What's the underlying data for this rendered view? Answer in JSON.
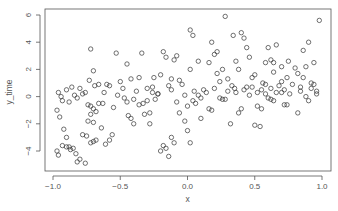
{
  "chart_data": {
    "type": "scatter",
    "title": "",
    "xlabel": "x",
    "ylabel": "y_time",
    "xlim": [
      -1.07,
      1.07
    ],
    "ylim": [
      -5.6,
      6.6
    ],
    "x_ticks": [
      -1.0,
      -0.5,
      0.0,
      0.5,
      1.0
    ],
    "x_tick_labels": [
      "-1.0",
      "-0.5",
      "0.0",
      "0.5",
      "1.0"
    ],
    "y_ticks": [
      -4,
      -2,
      0,
      2,
      4,
      6
    ],
    "y_tick_labels": [
      "-4",
      "-2",
      "0",
      "2",
      "4",
      "6"
    ],
    "grid": false,
    "legend": null,
    "marker": "open-circle",
    "marker_color": "#333333",
    "points": [
      [
        -0.96,
        0.3
      ],
      [
        -0.94,
        0.0
      ],
      [
        -0.93,
        -0.3
      ],
      [
        -0.9,
        0.5
      ],
      [
        -0.88,
        -0.4
      ],
      [
        -0.86,
        0.7
      ],
      [
        -0.84,
        0.1
      ],
      [
        -0.82,
        -0.1
      ],
      [
        -0.8,
        0.6
      ],
      [
        -0.78,
        0.2
      ],
      [
        -0.97,
        -1.0
      ],
      [
        -0.95,
        -1.5
      ],
      [
        -0.92,
        -2.4
      ],
      [
        -0.9,
        -3.0
      ],
      [
        -0.88,
        -3.7
      ],
      [
        -0.85,
        -3.8
      ],
      [
        -0.83,
        -4.2
      ],
      [
        -0.8,
        -4.6
      ],
      [
        -0.78,
        -2.8
      ],
      [
        -0.75,
        -2.9
      ],
      [
        -0.97,
        -4.0
      ],
      [
        -0.96,
        -4.3
      ],
      [
        -0.93,
        -3.6
      ],
      [
        -0.9,
        -3.7
      ],
      [
        -0.87,
        -3.9
      ],
      [
        -0.82,
        -4.8
      ],
      [
        -0.76,
        -4.9
      ],
      [
        -0.72,
        -3.4
      ],
      [
        -0.7,
        -3.3
      ],
      [
        -0.68,
        -3.2
      ],
      [
        -0.76,
        0.3
      ],
      [
        -0.74,
        -0.6
      ],
      [
        -0.72,
        -0.7
      ],
      [
        -0.7,
        -0.9
      ],
      [
        -0.72,
        -1.3
      ],
      [
        -0.68,
        -1.1
      ],
      [
        -0.74,
        -1.8
      ],
      [
        -0.7,
        -1.9
      ],
      [
        -0.66,
        -0.5
      ],
      [
        -0.64,
        -2.3
      ],
      [
        -0.72,
        3.5
      ],
      [
        -0.7,
        1.9
      ],
      [
        -0.73,
        1.2
      ],
      [
        -0.69,
        0.8
      ],
      [
        -0.66,
        0.9
      ],
      [
        -0.63,
        -0.5
      ],
      [
        -0.61,
        -3.5
      ],
      [
        -0.58,
        -3.2
      ],
      [
        -0.56,
        -2.8
      ],
      [
        -0.53,
        3.2
      ],
      [
        -0.5,
        1.1
      ],
      [
        -0.48,
        0.6
      ],
      [
        -0.45,
        2.4
      ],
      [
        -0.42,
        1.3
      ],
      [
        -0.4,
        -0.2
      ],
      [
        -0.38,
        0.4
      ],
      [
        -0.36,
        1.4
      ],
      [
        -0.34,
        3.2
      ],
      [
        -0.32,
        -1.3
      ],
      [
        -0.3,
        0.6
      ],
      [
        -0.47,
        -0.1
      ],
      [
        -0.45,
        -0.4
      ],
      [
        -0.44,
        -1.4
      ],
      [
        -0.42,
        -1.6
      ],
      [
        -0.4,
        -2.0
      ],
      [
        -0.36,
        -0.6
      ],
      [
        -0.33,
        -0.5
      ],
      [
        -0.3,
        -0.3
      ],
      [
        -0.28,
        -2.0
      ],
      [
        -0.26,
        0.7
      ],
      [
        -0.28,
        -1.2
      ],
      [
        -0.26,
        0.3
      ],
      [
        -0.24,
        -0.2
      ],
      [
        -0.22,
        0.2
      ],
      [
        -0.2,
        -4.0
      ],
      [
        -0.18,
        -3.6
      ],
      [
        -0.16,
        -3.8
      ],
      [
        -0.14,
        -4.4
      ],
      [
        -0.12,
        -3.0
      ],
      [
        -0.1,
        -3.4
      ],
      [
        -0.25,
        1.4
      ],
      [
        -0.22,
        0.2
      ],
      [
        -0.2,
        1.6
      ],
      [
        -0.18,
        3.3
      ],
      [
        -0.16,
        2.9
      ],
      [
        -0.14,
        0.8
      ],
      [
        -0.12,
        1.3
      ],
      [
        -0.1,
        2.7
      ],
      [
        -0.08,
        3.0
      ],
      [
        -0.06,
        1.2
      ],
      [
        -0.04,
        0.9
      ],
      [
        -0.02,
        0.1
      ],
      [
        0.0,
        -0.7
      ],
      [
        0.02,
        4.9
      ],
      [
        -0.02,
        -1.8
      ],
      [
        0.0,
        -2.5
      ],
      [
        0.02,
        -3.4
      ],
      [
        0.04,
        4.5
      ],
      [
        0.06,
        -0.5
      ],
      [
        0.08,
        2.6
      ],
      [
        0.02,
        2.0
      ],
      [
        0.05,
        0.4
      ],
      [
        0.08,
        0.1
      ],
      [
        0.1,
        -0.1
      ],
      [
        0.12,
        0.5
      ],
      [
        0.14,
        0.3
      ],
      [
        0.16,
        -0.9
      ],
      [
        0.18,
        -1.0
      ],
      [
        0.2,
        0.6
      ],
      [
        0.22,
        1.7
      ],
      [
        0.16,
        2.5
      ],
      [
        0.18,
        4.0
      ],
      [
        0.2,
        3.1
      ],
      [
        0.22,
        3.3
      ],
      [
        0.24,
        1.1
      ],
      [
        0.26,
        2.0
      ],
      [
        0.28,
        5.9
      ],
      [
        0.28,
        -0.2
      ],
      [
        0.3,
        0.4
      ],
      [
        0.32,
        -2.0
      ],
      [
        0.24,
        -0.1
      ],
      [
        0.26,
        -0.2
      ],
      [
        0.3,
        1.3
      ],
      [
        0.33,
        0.8
      ],
      [
        0.35,
        0.6
      ],
      [
        0.36,
        0.3
      ],
      [
        0.38,
        -1.2
      ],
      [
        0.4,
        -0.9
      ],
      [
        0.42,
        0.5
      ],
      [
        0.44,
        0.7
      ],
      [
        0.4,
        4.7
      ],
      [
        0.42,
        4.3
      ],
      [
        0.44,
        3.6
      ],
      [
        0.46,
        2.9
      ],
      [
        0.46,
        0.1
      ],
      [
        0.48,
        1.4
      ],
      [
        0.5,
        1.6
      ],
      [
        0.52,
        0.3
      ],
      [
        0.5,
        -2.1
      ],
      [
        0.54,
        -2.2
      ],
      [
        0.34,
        4.5
      ],
      [
        0.36,
        2.6
      ],
      [
        0.38,
        2.0
      ],
      [
        0.48,
        0.7
      ],
      [
        0.55,
        0.5
      ],
      [
        0.56,
        1.0
      ],
      [
        0.58,
        2.5
      ],
      [
        0.6,
        -0.1
      ],
      [
        0.62,
        0.6
      ],
      [
        0.64,
        1.8
      ],
      [
        0.52,
        -0.7
      ],
      [
        0.55,
        -0.9
      ],
      [
        0.58,
        0.9
      ],
      [
        0.6,
        3.6
      ],
      [
        0.62,
        2.7
      ],
      [
        0.64,
        2.5
      ],
      [
        0.66,
        3.8
      ],
      [
        0.68,
        0.8
      ],
      [
        0.7,
        1.1
      ],
      [
        0.72,
        -0.6
      ],
      [
        0.7,
        2.2
      ],
      [
        0.72,
        0.5
      ],
      [
        0.74,
        1.4
      ],
      [
        0.75,
        2.6
      ],
      [
        0.76,
        0.2
      ],
      [
        0.78,
        0.9
      ],
      [
        0.8,
        2.1
      ],
      [
        0.82,
        -1.2
      ],
      [
        0.84,
        0.7
      ],
      [
        0.86,
        1.4
      ],
      [
        0.82,
        1.7
      ],
      [
        0.84,
        0.4
      ],
      [
        0.86,
        3.4
      ],
      [
        0.88,
        2.2
      ],
      [
        0.88,
        0.0
      ],
      [
        0.9,
        4.0
      ],
      [
        0.92,
        1.0
      ],
      [
        0.94,
        2.5
      ],
      [
        0.96,
        0.2
      ],
      [
        0.98,
        5.6
      ],
      [
        0.9,
        -0.3
      ],
      [
        0.92,
        0.6
      ],
      [
        0.94,
        0.9
      ],
      [
        0.96,
        0.4
      ],
      [
        0.74,
        -0.6
      ],
      [
        0.7,
        0.3
      ],
      [
        0.66,
        0.3
      ],
      [
        0.64,
        -0.3
      ],
      [
        0.62,
        -0.2
      ],
      [
        0.58,
        0.2
      ],
      [
        -0.6,
        0.9
      ],
      [
        -0.62,
        0.3
      ],
      [
        -0.58,
        0.8
      ],
      [
        -0.55,
        -0.8
      ],
      [
        -0.52,
        0.1
      ],
      [
        -0.12,
        0.5
      ],
      [
        -0.08,
        -0.4
      ],
      [
        -0.06,
        -1.2
      ],
      [
        0.04,
        -0.3
      ],
      [
        0.1,
        -1.6
      ]
    ]
  }
}
